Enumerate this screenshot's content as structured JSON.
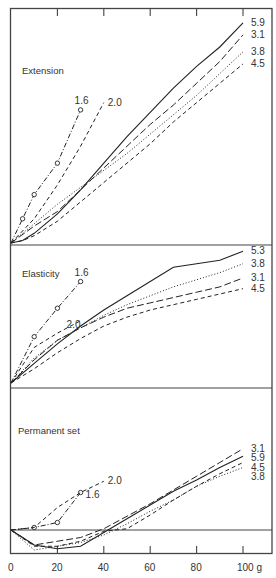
{
  "chart_data": {
    "type": "line",
    "layout": "three vertically stacked panels sharing x-axis",
    "xlabel": "g",
    "x_ticks": [
      0,
      20,
      40,
      60,
      80,
      100
    ],
    "x_tick_labels": [
      "0",
      "20",
      "40",
      "60",
      "80",
      "100 g"
    ],
    "xlim": [
      0,
      110
    ],
    "grid": false,
    "legend": "direct line-end labels",
    "panels": [
      {
        "title": "Extension",
        "series": [
          {
            "name": "5.9",
            "style": "solid",
            "x": [
              0,
              5,
              10,
              20,
              30,
              40,
              50,
              60,
              70,
              80,
              90,
              100
            ],
            "y": [
              0,
              1,
              4,
              12,
              22,
              33,
              44,
              54,
              64,
              73,
              81,
              91
            ]
          },
          {
            "name": "3.1",
            "style": "long-dash",
            "x": [
              0,
              10,
              20,
              30,
              40,
              50,
              60,
              70,
              80,
              90,
              100
            ],
            "y": [
              0,
              7,
              13,
              22,
              31,
              40,
              49,
              57,
              66,
              75,
              86
            ]
          },
          {
            "name": "3.8",
            "style": "dotted",
            "x": [
              0,
              10,
              20,
              30,
              40,
              50,
              60,
              70,
              80,
              90,
              100
            ],
            "y": [
              0,
              8,
              16,
              23,
              30,
              37,
              45,
              53,
              61,
              70,
              79
            ]
          },
          {
            "name": "4.5",
            "style": "dashed",
            "x": [
              0,
              5,
              10,
              20,
              30,
              40,
              50,
              60,
              70,
              80,
              90,
              100
            ],
            "y": [
              0,
              1,
              3,
              9,
              17,
              25,
              33,
              41,
              50,
              58,
              66,
              74
            ]
          },
          {
            "name": "1.6",
            "style": "dash-dot-circle",
            "x": [
              0,
              5,
              10,
              20,
              30
            ],
            "y": [
              0,
              10,
              20,
              33,
              55
            ]
          },
          {
            "name": "2.0",
            "style": "dashed",
            "x": [
              0,
              10,
              20,
              30,
              40
            ],
            "y": [
              0,
              10,
              24,
              40,
              58
            ]
          }
        ]
      },
      {
        "title": "Elasticity",
        "series": [
          {
            "name": "5.3",
            "style": "solid",
            "x": [
              0,
              10,
              20,
              30,
              40,
              50,
              60,
              70,
              80,
              90,
              100
            ],
            "y": [
              0,
              11,
              22,
              32,
              41,
              49,
              57,
              65,
              67,
              69,
              74
            ]
          },
          {
            "name": "3.8",
            "style": "dotted",
            "x": [
              0,
              10,
              20,
              30,
              40,
              50,
              60,
              70,
              80,
              90,
              100
            ],
            "y": [
              0,
              14,
              24,
              31,
              38,
              44,
              49,
              54,
              58,
              62,
              67
            ]
          },
          {
            "name": "3.1",
            "style": "long-dash",
            "x": [
              0,
              10,
              20,
              30,
              40,
              50,
              60,
              70,
              80,
              90,
              100
            ],
            "y": [
              0,
              13,
              24,
              31,
              37,
              42,
              45,
              48,
              51,
              54,
              59
            ]
          },
          {
            "name": "4.5",
            "style": "dashed",
            "x": [
              0,
              10,
              20,
              30,
              40,
              50,
              60,
              70,
              80,
              90,
              100
            ],
            "y": [
              0,
              8,
              17,
              25,
              32,
              37,
              41,
              44,
              47,
              50,
              53
            ]
          },
          {
            "name": "1.6",
            "style": "dash-dot-circle",
            "x": [
              0,
              10,
              20,
              30
            ],
            "y": [
              0,
              26,
              42,
              57
            ]
          },
          {
            "name": "2.0",
            "style": "dashed",
            "x": [
              0,
              10,
              20,
              30
            ],
            "y": [
              0,
              20,
              28,
              35
            ]
          }
        ]
      },
      {
        "title": "Permanent set",
        "series": [
          {
            "name": "3.1",
            "style": "long-dash",
            "x": [
              0,
              10,
              20,
              30,
              40,
              50,
              60,
              70,
              80,
              90,
              100
            ],
            "y": [
              0,
              -12,
              -9,
              -6,
              1,
              11,
              21,
              32,
              43,
              54,
              65
            ]
          },
          {
            "name": "5.9",
            "style": "solid",
            "x": [
              0,
              10,
              20,
              30,
              40,
              50,
              60,
              70,
              80,
              90,
              100
            ],
            "y": [
              0,
              -12,
              -15,
              -13,
              -2,
              9,
              20,
              31,
              40,
              50,
              59
            ]
          },
          {
            "name": "4.5",
            "style": "dashed",
            "x": [
              0,
              10,
              20,
              30,
              40,
              50,
              60,
              70,
              80,
              90,
              100
            ],
            "y": [
              0,
              -13,
              -13,
              -9,
              -1,
              1,
              12,
              24,
              35,
              45,
              54
            ]
          },
          {
            "name": "3.8",
            "style": "dotted",
            "x": [
              0,
              10,
              20,
              30,
              40,
              50,
              60,
              70,
              80,
              90,
              100
            ],
            "y": [
              0,
              -16,
              -13,
              -10,
              -4,
              5,
              15,
              24,
              35,
              43,
              50
            ]
          },
          {
            "name": "1.6",
            "style": "dash-dot-circle",
            "x": [
              0,
              10,
              20,
              30
            ],
            "y": [
              0,
              2,
              6,
              30
            ]
          },
          {
            "name": "2.0",
            "style": "dashed",
            "x": [
              0,
              10,
              20,
              30,
              40
            ],
            "y": [
              0,
              2,
              18,
              30,
              39
            ]
          }
        ]
      }
    ]
  },
  "labels": {
    "panel1_title": "Extension",
    "panel2_title": "Elasticity",
    "panel3_title": "Permanent set",
    "x_unit": "g"
  }
}
